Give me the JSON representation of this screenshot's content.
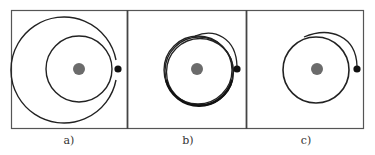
{
  "figure": {
    "panels": [
      {
        "id": "a",
        "label": "a)",
        "description": "Inner circular orbit plus outer spiral path ending near satellite dot"
      },
      {
        "id": "b",
        "label": "b)",
        "description": "Multiple overlapping near-circular orbits with short transfer arc to satellite dot"
      },
      {
        "id": "c",
        "label": "c)",
        "description": "Single circular orbit with transfer arc to satellite dot"
      }
    ],
    "colors": {
      "frame": "#555555",
      "orbit": "#222222",
      "central_body": "#6b6b6b",
      "satellite": "#111111"
    }
  }
}
